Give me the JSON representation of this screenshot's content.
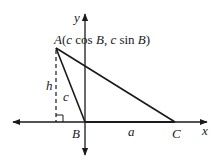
{
  "diagram": {
    "axes": {
      "x_label": "x",
      "y_label": "y"
    },
    "points": {
      "A": {
        "label": "A",
        "coords_text": [
          "(",
          "c",
          " cos ",
          "B",
          ", ",
          "c",
          " sin ",
          "B",
          ")"
        ]
      },
      "B": {
        "label": "B"
      },
      "C": {
        "label": "C"
      }
    },
    "sides": {
      "a": "a",
      "c": "c"
    },
    "height": {
      "label": "h"
    },
    "colors": {
      "stroke": "#1a1a1a",
      "background": "#ffffff"
    }
  }
}
